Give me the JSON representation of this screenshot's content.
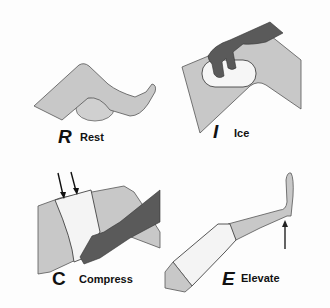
{
  "panels": [
    {
      "letter": "R",
      "word": "Rest"
    },
    {
      "letter": "I",
      "word": "Ice"
    },
    {
      "letter": "C",
      "word": "Compress"
    },
    {
      "letter": "E",
      "word": "Elevate"
    }
  ],
  "colors": {
    "skin": "#c8c8c8",
    "outline": "#555555",
    "hand": "#5a5a5a",
    "bandage": "#f4f4f4",
    "background": "#fdfdfd"
  }
}
